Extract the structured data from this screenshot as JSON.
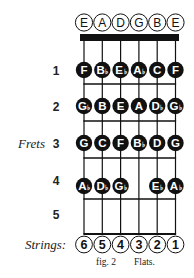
{
  "diagram": {
    "open_strings": [
      "E",
      "A",
      "D",
      "G",
      "B",
      "E"
    ],
    "frets_label": "Frets",
    "strings_label": "Strings:",
    "fret_numbers": [
      "1",
      "2",
      "3",
      "4",
      "5"
    ],
    "string_numbers": [
      "6",
      "5",
      "4",
      "3",
      "2",
      "1"
    ],
    "frets": [
      {
        "fret": "1",
        "notes": [
          {
            "name": "F",
            "flat": false
          },
          {
            "name": "B",
            "flat": true
          },
          {
            "name": "E",
            "flat": true
          },
          {
            "name": "A",
            "flat": true
          },
          {
            "name": "C",
            "flat": false
          },
          {
            "name": "F",
            "flat": false
          }
        ]
      },
      {
        "fret": "2",
        "notes": [
          {
            "name": "G",
            "flat": true
          },
          {
            "name": "B",
            "flat": false
          },
          {
            "name": "E",
            "flat": false
          },
          {
            "name": "A",
            "flat": false
          },
          {
            "name": "D",
            "flat": true
          },
          {
            "name": "G",
            "flat": true
          }
        ]
      },
      {
        "fret": "3",
        "notes": [
          {
            "name": "G",
            "flat": false
          },
          {
            "name": "C",
            "flat": false
          },
          {
            "name": "F",
            "flat": false
          },
          {
            "name": "B",
            "flat": true
          },
          {
            "name": "D",
            "flat": false
          },
          {
            "name": "G",
            "flat": false
          }
        ]
      },
      {
        "fret": "4",
        "notes": [
          {
            "name": "A",
            "flat": true
          },
          {
            "name": "D",
            "flat": true
          },
          {
            "name": "G",
            "flat": true
          },
          null,
          {
            "name": "E",
            "flat": true
          },
          {
            "name": "A",
            "flat": true
          }
        ]
      },
      {
        "fret": "5",
        "notes": [
          null,
          null,
          null,
          null,
          null,
          null
        ]
      }
    ],
    "caption": {
      "fig": "fig. 2",
      "title": "Flats."
    },
    "colors": {
      "ink": "#111111",
      "paper": "#ffffff"
    }
  }
}
